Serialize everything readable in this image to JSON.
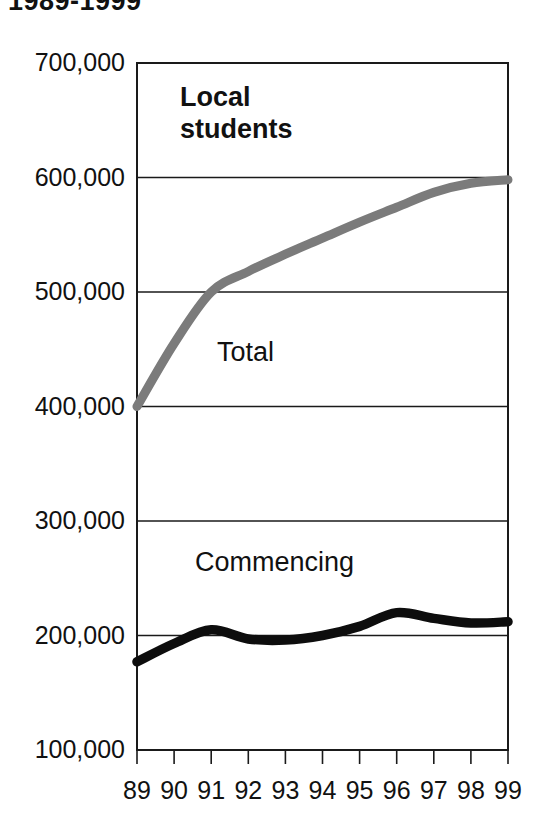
{
  "title": "1989-1999",
  "panel": {
    "label_line1": "Local",
    "label_line2": "students"
  },
  "series_labels": {
    "total": "Total",
    "commencing": "Commencing"
  },
  "colors": {
    "total": "#7b7b7b",
    "commencing": "#0d0d0d",
    "axis": "#1a1a1a",
    "background": "#ffffff"
  },
  "axes": {
    "y_ticks": [
      "700,000",
      "600,000",
      "500,000",
      "400,000",
      "300,000",
      "200,000",
      "100,000"
    ],
    "x_ticks": [
      "89",
      "90",
      "91",
      "92",
      "93",
      "94",
      "95",
      "96",
      "97",
      "98",
      "99"
    ],
    "ylabel": "",
    "xlabel": ""
  },
  "chart_data": {
    "type": "line",
    "title": "1989-1999",
    "subtitle": "Local students",
    "xlabel": "",
    "ylabel": "",
    "x": [
      "89",
      "90",
      "91",
      "92",
      "93",
      "94",
      "95",
      "96",
      "97",
      "98",
      "99"
    ],
    "x_full_years": [
      1989,
      1990,
      1991,
      1992,
      1993,
      1994,
      1995,
      1996,
      1997,
      1998,
      1999
    ],
    "xlim": [
      89,
      99
    ],
    "ylim": [
      100000,
      700000
    ],
    "y_tick_values": [
      100000,
      200000,
      300000,
      400000,
      500000,
      600000,
      700000
    ],
    "grid": true,
    "grid_axis": "y",
    "legend": "inline-labels",
    "annotations": [
      {
        "text": "Local students",
        "kind": "panel-title"
      },
      {
        "text": "Total",
        "kind": "series-label",
        "series": "Total"
      },
      {
        "text": "Commencing",
        "kind": "series-label",
        "series": "Commencing"
      }
    ],
    "series": [
      {
        "name": "Total",
        "color": "#7b7b7b",
        "values": [
          400000,
          455000,
          500000,
          518000,
          533000,
          547000,
          561000,
          574000,
          587000,
          595000,
          598000
        ]
      },
      {
        "name": "Commencing",
        "color": "#0d0d0d",
        "values": [
          177000,
          193000,
          205000,
          197000,
          196000,
          200000,
          208000,
          220000,
          215000,
          211000,
          212000
        ]
      }
    ]
  },
  "plot_geometry": {
    "left": 137,
    "right": 508,
    "top": 63,
    "bottom": 750
  }
}
